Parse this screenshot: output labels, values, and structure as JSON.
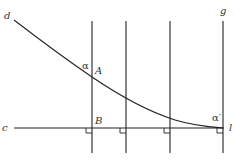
{
  "diagram": {
    "labels": {
      "d": "d",
      "g": "g",
      "c": "c",
      "l": "l",
      "A": "A",
      "B": "B",
      "alpha": "α",
      "alpha_prime": "α′"
    },
    "stroke_color": "#222222",
    "vertical_lines_x": [
      92,
      126,
      170,
      223
    ],
    "horizontal_line_y": 127
  }
}
